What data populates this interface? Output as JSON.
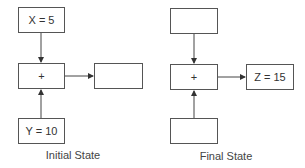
{
  "diagram": {
    "initial": {
      "caption": "Initial State",
      "top_box": "X = 5",
      "middle_box": "+",
      "bottom_box": "Y = 10",
      "output_box": ""
    },
    "final": {
      "caption": "Final State",
      "top_box": "",
      "middle_box": "+",
      "bottom_box": "",
      "output_box": "Z = 15"
    }
  }
}
